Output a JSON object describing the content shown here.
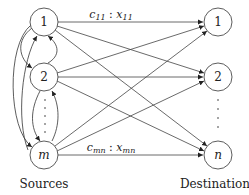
{
  "diagram": {
    "type": "transportation-network",
    "sources": {
      "caption": "Sources",
      "nodes": [
        {
          "id": "s1",
          "label": "1"
        },
        {
          "id": "s2",
          "label": "2"
        },
        {
          "id": "sm",
          "label": "m"
        }
      ],
      "ellipsis": "⋮"
    },
    "destinations": {
      "caption": "Destinations",
      "nodes": [
        {
          "id": "d1",
          "label": "1"
        },
        {
          "id": "d2",
          "label": "2"
        },
        {
          "id": "dn",
          "label": "n"
        }
      ],
      "ellipsis": "⋮"
    },
    "edge_labels": {
      "top": {
        "c": "c",
        "c_sub": "11",
        "sep": " : ",
        "x": "x",
        "x_sub": "11"
      },
      "bottom": {
        "c": "c",
        "c_sub": "mn",
        "sep": " : ",
        "x": "x",
        "x_sub": "mn"
      }
    },
    "colors": {
      "stroke": "#333333",
      "text": "#222222",
      "background": "#ffffff"
    }
  }
}
